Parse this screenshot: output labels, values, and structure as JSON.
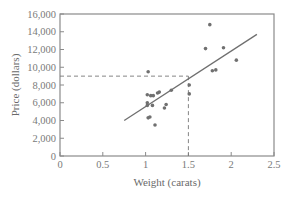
{
  "chart_data": {
    "type": "scatter",
    "title": "",
    "xlabel": "Weight (carats)",
    "ylabel": "Price (dollars)",
    "xlim": [
      0,
      2.5
    ],
    "ylim": [
      0,
      16000
    ],
    "xticks": [
      0,
      0.5,
      1,
      1.5,
      2,
      2.5
    ],
    "xtick_labels": [
      "0",
      "0.5",
      "1",
      "1.5",
      "2",
      "2.5"
    ],
    "yticks": [
      0,
      2000,
      4000,
      6000,
      8000,
      10000,
      12000,
      14000,
      16000
    ],
    "ytick_labels": [
      "0",
      "2,000",
      "4,000",
      "6,000",
      "8,000",
      "10,000",
      "12,000",
      "14,000",
      "16,000"
    ],
    "grid": false,
    "legend": null,
    "series": [
      {
        "name": "Diamonds",
        "points": [
          {
            "x": 1.03,
            "y": 9500
          },
          {
            "x": 1.02,
            "y": 6900
          },
          {
            "x": 1.06,
            "y": 6800
          },
          {
            "x": 1.09,
            "y": 6800
          },
          {
            "x": 1.14,
            "y": 7100
          },
          {
            "x": 1.16,
            "y": 7200
          },
          {
            "x": 1.3,
            "y": 7400
          },
          {
            "x": 1.02,
            "y": 6000
          },
          {
            "x": 1.02,
            "y": 5700
          },
          {
            "x": 1.08,
            "y": 5700
          },
          {
            "x": 1.22,
            "y": 5400
          },
          {
            "x": 1.24,
            "y": 5800
          },
          {
            "x": 1.03,
            "y": 4300
          },
          {
            "x": 1.05,
            "y": 4400
          },
          {
            "x": 1.11,
            "y": 3500
          },
          {
            "x": 1.51,
            "y": 8000
          },
          {
            "x": 1.51,
            "y": 7000
          },
          {
            "x": 1.7,
            "y": 12100
          },
          {
            "x": 1.75,
            "y": 14800
          },
          {
            "x": 1.78,
            "y": 9600
          },
          {
            "x": 1.82,
            "y": 9700
          },
          {
            "x": 1.91,
            "y": 12200
          },
          {
            "x": 2.06,
            "y": 10800
          }
        ]
      }
    ],
    "regression_line": {
      "x1": 0.75,
      "y1": 4000,
      "x2": 2.3,
      "y2": 13700
    },
    "annotation": {
      "type": "dashed-guides",
      "x": 1.5,
      "y": 9000,
      "description": "Dashed lines from x-axis at 1.5 carats up to regression line and across to y-axis at about $9,000"
    }
  }
}
